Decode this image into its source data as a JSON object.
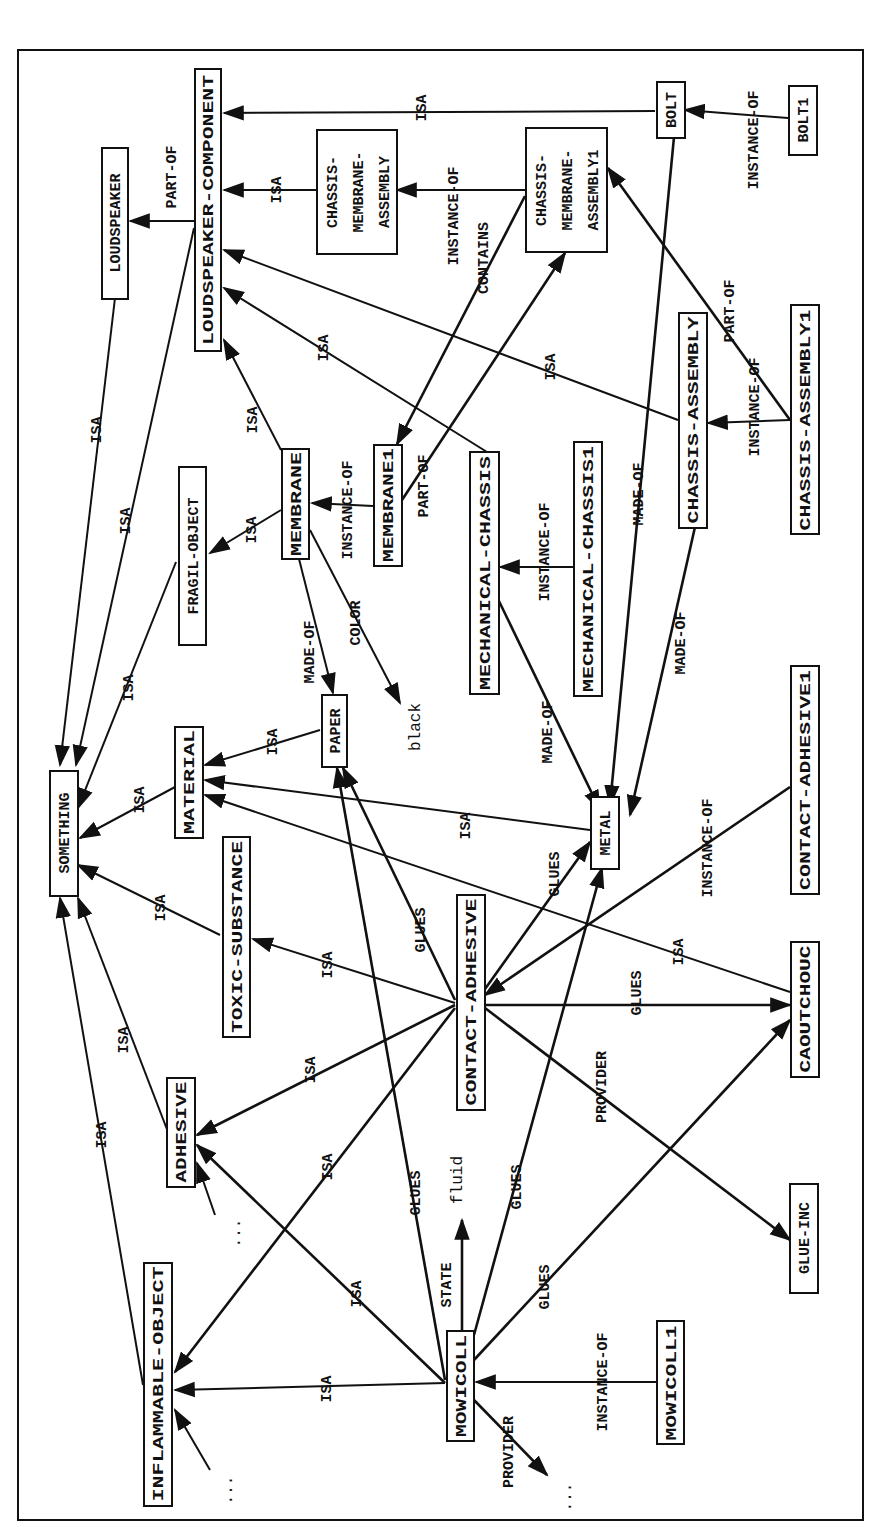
{
  "diagram": {
    "type": "semantic-network",
    "orientation": "rotated-90-ccw",
    "colors": {
      "stroke": "#111111",
      "background": "#ffffff"
    },
    "nodes": [
      {
        "id": "something",
        "label": "SOMETHING",
        "boxed": true
      },
      {
        "id": "loudspeaker",
        "label": "LOUDSPEAKER",
        "boxed": true
      },
      {
        "id": "loudspeaker_component",
        "label": "LOUDSPEAKER-COMPONENT",
        "boxed": true
      },
      {
        "id": "chassis_membrane_assembly",
        "label": "CHASSIS-MEMBRANE-ASSEMBLY",
        "lines": [
          "CHASSIS-",
          "MEMBRANE-",
          "ASSEMBLY"
        ],
        "boxed": true
      },
      {
        "id": "chassis_membrane_assembly1",
        "label": "CHASSIS-MEMBRANE-ASSEMBLY1",
        "lines": [
          "CHASSIS-",
          "MEMBRANE-",
          "ASSEMBLY1"
        ],
        "boxed": true
      },
      {
        "id": "bolt",
        "label": "BOLT",
        "boxed": true
      },
      {
        "id": "bolt1",
        "label": "BOLT1",
        "boxed": true
      },
      {
        "id": "fragil_object",
        "label": "FRAGIL-OBJECT",
        "boxed": true
      },
      {
        "id": "membrane",
        "label": "MEMBRANE",
        "boxed": true
      },
      {
        "id": "membrane1",
        "label": "MEMBRANE1",
        "boxed": true
      },
      {
        "id": "mechanical_chassis",
        "label": "MECHANICAL-CHASSIS",
        "boxed": true
      },
      {
        "id": "mechanical_chassis1",
        "label": "MECHANICAL-CHASSIS1",
        "boxed": true
      },
      {
        "id": "chassis_assembly",
        "label": "CHASSIS-ASSEMBLY",
        "boxed": true
      },
      {
        "id": "chassis_assembly1",
        "label": "CHASSIS-ASSEMBLY1",
        "boxed": true
      },
      {
        "id": "material",
        "label": "MATERIAL",
        "boxed": true
      },
      {
        "id": "paper",
        "label": "PAPER",
        "boxed": true
      },
      {
        "id": "black",
        "label": "black",
        "boxed": false
      },
      {
        "id": "metal",
        "label": "METAL",
        "boxed": true
      },
      {
        "id": "toxic_substance",
        "label": "TOXIC-SUBSTANCE",
        "boxed": true
      },
      {
        "id": "contact_adhesive",
        "label": "CONTACT-ADHESIVE",
        "boxed": true
      },
      {
        "id": "contact_adhesive1",
        "label": "CONTACT-ADHESIVE1",
        "boxed": true
      },
      {
        "id": "caoutchouc",
        "label": "CAOUTCHOUC",
        "boxed": true
      },
      {
        "id": "adhesive",
        "label": "ADHESIVE",
        "boxed": true
      },
      {
        "id": "inflammable_object",
        "label": "INFLAMMABLE-OBJECT",
        "boxed": true
      },
      {
        "id": "mowicoll",
        "label": "MOWICOLL",
        "boxed": true
      },
      {
        "id": "mowicoll1",
        "label": "MOWICOLL1",
        "boxed": true
      },
      {
        "id": "glue_inc",
        "label": "GLUE-INC",
        "boxed": true
      },
      {
        "id": "fluid",
        "label": "fluid",
        "boxed": false
      },
      {
        "id": "ellipsis_adhesive",
        "label": "...",
        "boxed": false
      },
      {
        "id": "ellipsis_inflammable",
        "label": "...",
        "boxed": false
      },
      {
        "id": "ellipsis_provider",
        "label": "...",
        "boxed": false
      }
    ],
    "edges": [
      {
        "from": "loudspeaker_component",
        "to": "loudspeaker",
        "label": "PART-OF"
      },
      {
        "from": "loudspeaker",
        "to": "something",
        "label": "ISA"
      },
      {
        "from": "loudspeaker_component",
        "to": "something",
        "label": "ISA"
      },
      {
        "from": "bolt",
        "to": "loudspeaker_component",
        "label": "ISA"
      },
      {
        "from": "chassis_membrane_assembly",
        "to": "loudspeaker_component",
        "label": "ISA"
      },
      {
        "from": "chassis_membrane_assembly1",
        "to": "chassis_membrane_assembly",
        "label": "INSTANCE-OF"
      },
      {
        "from": "bolt1",
        "to": "bolt",
        "label": "INSTANCE-OF"
      },
      {
        "from": "chassis_assembly1",
        "to": "chassis_membrane_assembly1",
        "label": "PART-OF"
      },
      {
        "from": "chassis_membrane_assembly1",
        "to": "membrane1",
        "label": "CONTAINS"
      },
      {
        "from": "membrane1",
        "to": "chassis_membrane_assembly1",
        "label": "PART-OF"
      },
      {
        "from": "chassis_assembly",
        "to": "loudspeaker_component",
        "label": "ISA"
      },
      {
        "from": "mechanical_chassis",
        "to": "loudspeaker_component",
        "label": "ISA"
      },
      {
        "from": "membrane",
        "to": "loudspeaker_component",
        "label": "ISA"
      },
      {
        "from": "membrane",
        "to": "fragil_object",
        "label": "ISA"
      },
      {
        "from": "membrane1",
        "to": "membrane",
        "label": "INSTANCE-OF"
      },
      {
        "from": "fragil_object",
        "to": "something",
        "label": "ISA"
      },
      {
        "from": "membrane",
        "to": "paper",
        "label": "MADE-OF"
      },
      {
        "from": "membrane",
        "to": "black",
        "label": "COLOR"
      },
      {
        "from": "mechanical_chassis1",
        "to": "mechanical_chassis",
        "label": "INSTANCE-OF"
      },
      {
        "from": "mechanical_chassis",
        "to": "metal",
        "label": "MADE-OF"
      },
      {
        "from": "bolt",
        "to": "metal",
        "label": "MADE-OF"
      },
      {
        "from": "chassis_assembly",
        "to": "metal",
        "label": "MADE-OF"
      },
      {
        "from": "chassis_assembly1",
        "to": "chassis_assembly",
        "label": "INSTANCE-OF"
      },
      {
        "from": "paper",
        "to": "material",
        "label": "ISA"
      },
      {
        "from": "material",
        "to": "something",
        "label": "ISA"
      },
      {
        "from": "metal",
        "to": "material",
        "label": "ISA"
      },
      {
        "from": "caoutchouc",
        "to": "material",
        "label": "ISA"
      },
      {
        "from": "toxic_substance",
        "to": "something",
        "label": "ISA"
      },
      {
        "from": "contact_adhesive",
        "to": "toxic_substance",
        "label": "ISA"
      },
      {
        "from": "contact_adhesive",
        "to": "paper",
        "label": "GLUES"
      },
      {
        "from": "contact_adhesive",
        "to": "metal",
        "label": "GLUES"
      },
      {
        "from": "contact_adhesive",
        "to": "caoutchouc",
        "label": "GLUES"
      },
      {
        "from": "contact_adhesive",
        "to": "glue_inc",
        "label": "PROVIDER"
      },
      {
        "from": "contact_adhesive1",
        "to": "contact_adhesive",
        "label": "INSTANCE-OF"
      },
      {
        "from": "contact_adhesive",
        "to": "adhesive",
        "label": "ISA"
      },
      {
        "from": "contact_adhesive",
        "to": "inflammable_object",
        "label": "ISA"
      },
      {
        "from": "adhesive",
        "to": "something",
        "label": "ISA"
      },
      {
        "from": "inflammable_object",
        "to": "something",
        "label": "ISA"
      },
      {
        "from": "mowicoll",
        "to": "adhesive",
        "label": "ISA"
      },
      {
        "from": "mowicoll",
        "to": "inflammable_object",
        "label": "ISA"
      },
      {
        "from": "mowicoll",
        "to": "paper",
        "label": "GLUES"
      },
      {
        "from": "mowicoll",
        "to": "metal",
        "label": "GLUES"
      },
      {
        "from": "mowicoll",
        "to": "caoutchouc",
        "label": "GLUES"
      },
      {
        "from": "mowicoll",
        "to": "fluid",
        "label": "STATE"
      },
      {
        "from": "mowicoll",
        "to": "ellipsis_provider",
        "label": "PROVIDER"
      },
      {
        "from": "mowicoll1",
        "to": "mowicoll",
        "label": "INSTANCE-OF"
      },
      {
        "from": "ellipsis_adhesive",
        "to": "adhesive",
        "label": ""
      },
      {
        "from": "ellipsis_inflammable",
        "to": "inflammable_object",
        "label": ""
      }
    ]
  },
  "labels": {
    "n": {
      "something": "SOMETHING",
      "loudspeaker": "LOUDSPEAKER",
      "loudspeaker_component": "LOUDSPEAKER-COMPONENT",
      "cma_1": "CHASSIS-",
      "cma_2": "MEMBRANE-",
      "cma_3": "ASSEMBLY",
      "cma1_1": "CHASSIS-",
      "cma1_2": "MEMBRANE-",
      "cma1_3": "ASSEMBLY1",
      "bolt": "BOLT",
      "bolt1": "BOLT1",
      "fragil_object": "FRAGIL-OBJECT",
      "membrane": "MEMBRANE",
      "membrane1": "MEMBRANE1",
      "mechanical_chassis": "MECHANICAL-CHASSIS",
      "mechanical_chassis1": "MECHANICAL-CHASSIS1",
      "chassis_assembly": "CHASSIS-ASSEMBLY",
      "chassis_assembly1": "CHASSIS-ASSEMBLY1",
      "material": "MATERIAL",
      "paper": "PAPER",
      "black": "black",
      "metal": "METAL",
      "toxic_substance": "TOXIC-SUBSTANCE",
      "contact_adhesive": "CONTACT-ADHESIVE",
      "contact_adhesive1": "CONTACT-ADHESIVE1",
      "caoutchouc": "CAOUTCHOUC",
      "adhesive": "ADHESIVE",
      "inflammable_object": "INFLAMMABLE-OBJECT",
      "mowicoll": "MOWICOLL",
      "mowicoll1": "MOWICOLL1",
      "glue_inc": "GLUE-INC",
      "fluid": "fluid",
      "ellipsis": "..."
    },
    "e": {
      "isa": "ISA",
      "part_of": "PART-OF",
      "instance_of": "INSTANCE-OF",
      "contains": "CONTAINS",
      "made_of": "MADE-OF",
      "color": "COLOR",
      "glues": "GLUES",
      "provider": "PROVIDER",
      "state": "STATE"
    }
  }
}
